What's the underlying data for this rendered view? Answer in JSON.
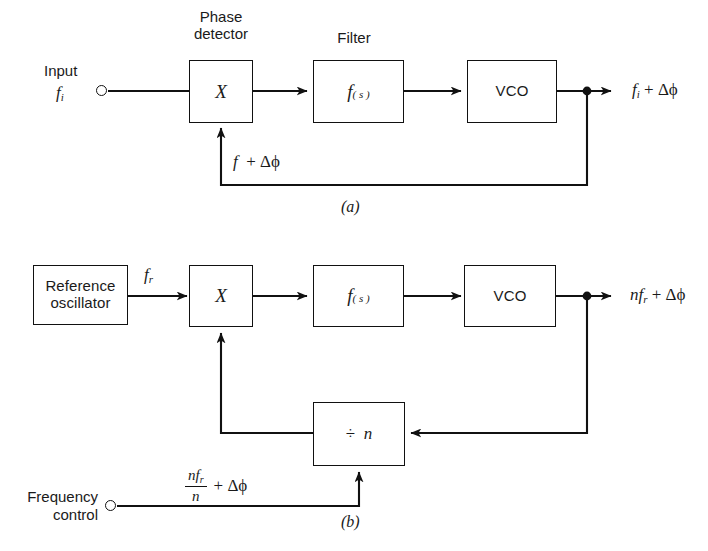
{
  "figure": {
    "caption_a": "(a)",
    "caption_b": "(b)"
  },
  "diagram_a": {
    "title_phase_detector_line1": "Phase",
    "title_phase_detector_line2": "detector",
    "title_filter": "Filter",
    "input_label_line1": "Input",
    "input_symbol_f": "f",
    "input_symbol_sub": "i",
    "phase_detector_symbol": "X",
    "filter_symbol_f": "f",
    "filter_symbol_s": "( s )",
    "vco_label": "VCO",
    "output_f": "f",
    "output_sub": "i",
    "output_plus": "+",
    "output_delta": "Δϕ",
    "feedback_f": "f",
    "feedback_plus": "+",
    "feedback_delta": "Δϕ"
  },
  "diagram_b": {
    "reference_line1": "Reference",
    "reference_line2": "oscillator",
    "ref_out_f": "f",
    "ref_out_sub": "r",
    "phase_detector_symbol": "X",
    "filter_symbol_f": "f",
    "filter_symbol_s": "( s )",
    "vco_label": "VCO",
    "divider_div": "÷",
    "divider_n": "n",
    "output_n": "n",
    "output_f": "f",
    "output_sub": "r",
    "output_plus": "+",
    "output_delta": "Δϕ",
    "control_line1": "Frequency",
    "control_line2": "control",
    "control_num_n": "n",
    "control_num_f": "f",
    "control_num_sub": "r",
    "control_den": "n",
    "control_plus": "+",
    "control_delta": "Δϕ"
  },
  "colors": {
    "ink": "#111111",
    "paper": "#ffffff"
  }
}
